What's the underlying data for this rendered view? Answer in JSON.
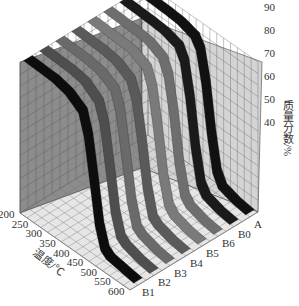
{
  "chart_data": {
    "type": "3d-ribbon",
    "title": "",
    "xlabel": "温度/℃",
    "ylabel": "",
    "zlabel": "质量分数/%",
    "x_ticks": [
      200,
      250,
      300,
      350,
      400,
      450,
      500,
      550,
      600
    ],
    "y_ticks": [
      "A",
      "B0",
      "B6",
      "B5",
      "B4",
      "B3",
      "B2",
      "B1"
    ],
    "z_ticks": [
      40,
      50,
      60,
      70,
      80,
      90,
      100
    ],
    "xlim": [
      200,
      600
    ],
    "zlim": [
      35,
      100
    ],
    "grid": true,
    "series": [
      {
        "name": "A",
        "color": "#111111",
        "x": [
          200,
          300,
          350,
          400,
          420,
          440,
          460,
          480,
          500,
          550,
          600
        ],
        "values": [
          100,
          99.5,
          99,
          97,
          93,
          80,
          60,
          45,
          40,
          38,
          37
        ]
      },
      {
        "name": "B0",
        "color": "#1a1a1a",
        "x": [
          200,
          300,
          350,
          400,
          420,
          440,
          460,
          480,
          500,
          550,
          600
        ],
        "values": [
          100,
          99.5,
          99,
          97,
          92,
          78,
          58,
          44,
          40,
          38,
          37
        ]
      },
      {
        "name": "B6",
        "color": "#6e6e6e",
        "x": [
          200,
          300,
          350,
          400,
          420,
          440,
          460,
          480,
          500,
          550,
          600
        ],
        "values": [
          100,
          99.5,
          99,
          96,
          90,
          75,
          55,
          43,
          40,
          38,
          37
        ]
      },
      {
        "name": "B5",
        "color": "#7a7a7a",
        "x": [
          200,
          300,
          350,
          400,
          420,
          440,
          460,
          480,
          500,
          550,
          600
        ],
        "values": [
          100,
          99.5,
          99,
          96,
          89,
          73,
          54,
          43,
          40,
          38,
          37
        ]
      },
      {
        "name": "B4",
        "color": "#5a5a5a",
        "x": [
          200,
          300,
          350,
          400,
          420,
          440,
          460,
          480,
          500,
          550,
          600
        ],
        "values": [
          100,
          99.5,
          98.5,
          95,
          88,
          72,
          53,
          42,
          40,
          38,
          37
        ]
      },
      {
        "name": "B3",
        "color": "#6a6a6a",
        "x": [
          200,
          300,
          350,
          400,
          420,
          440,
          460,
          480,
          500,
          550,
          600
        ],
        "values": [
          100,
          99.5,
          98.5,
          95,
          87,
          70,
          52,
          42,
          40,
          38,
          37
        ]
      },
      {
        "name": "B2",
        "color": "#4e4e4e",
        "x": [
          200,
          300,
          350,
          400,
          420,
          440,
          460,
          480,
          500,
          550,
          600
        ],
        "values": [
          100,
          99.5,
          98.5,
          94,
          86,
          69,
          51,
          42,
          40,
          38,
          37
        ]
      },
      {
        "name": "B1",
        "color": "#0d0d0d",
        "x": [
          200,
          300,
          350,
          400,
          420,
          440,
          460,
          480,
          500,
          550,
          600
        ],
        "values": [
          100,
          99.5,
          98,
          94,
          85,
          68,
          50,
          41,
          39,
          38,
          37
        ]
      }
    ]
  }
}
